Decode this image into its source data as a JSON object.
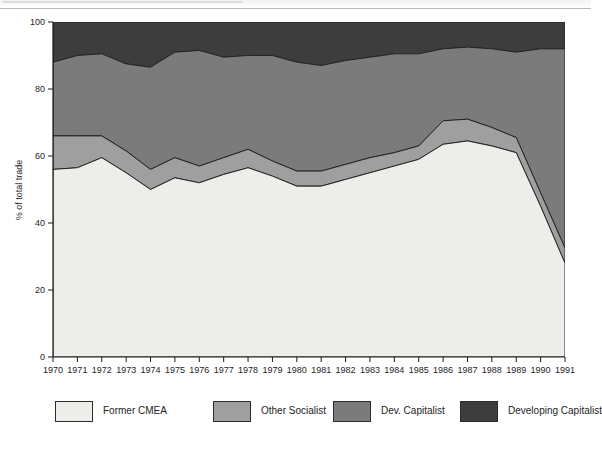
{
  "page": {
    "background_color": "#ffffff",
    "scan_edge": true
  },
  "chart_data": {
    "type": "area",
    "stacked": true,
    "title": "",
    "subtitle": "",
    "xlabel": "",
    "ylabel": "% of total trade",
    "ylim": [
      0,
      100
    ],
    "yticks": [
      0,
      20,
      40,
      60,
      80,
      100
    ],
    "ytick_labels": [
      "0",
      "20",
      "40",
      "60",
      "80",
      "100"
    ],
    "grid": false,
    "legend_position": "bottom",
    "x": [
      1970,
      1971,
      1972,
      1973,
      1974,
      1975,
      1976,
      1977,
      1978,
      1979,
      1980,
      1981,
      1982,
      1983,
      1984,
      1985,
      1986,
      1987,
      1988,
      1989,
      1990,
      1991
    ],
    "xtick_labels": [
      "1970",
      "1971",
      "1972",
      "1973",
      "1974",
      "1975",
      "1976",
      "1977",
      "1978",
      "1979",
      "1980",
      "1981",
      "1982",
      "1983",
      "1984",
      "1985",
      "1986",
      "1987",
      "1988",
      "1989",
      "1990",
      "1991"
    ],
    "series": [
      {
        "name": "Former CMEA",
        "color": "#ededea",
        "values": [
          56,
          56.5,
          59.5,
          55,
          50,
          53.5,
          52,
          54.5,
          56.5,
          54,
          51,
          51,
          53,
          55,
          57,
          59,
          63.5,
          64.5,
          63,
          61,
          45,
          28
        ]
      },
      {
        "name": "Other Socialist",
        "color": "#9f9f9f",
        "values": [
          10,
          9.5,
          6.5,
          6.5,
          6,
          6,
          5,
          5,
          5.5,
          4.5,
          4.5,
          4.5,
          4.5,
          4.5,
          4,
          4,
          7,
          6.5,
          5.5,
          4.5,
          4,
          4.5
        ]
      },
      {
        "name": "Dev. Capitalist",
        "color": "#7b7b7b",
        "values": [
          22,
          24,
          24.5,
          26,
          30.5,
          31.5,
          34.5,
          30,
          28,
          31.5,
          32.5,
          31.5,
          31,
          30,
          29.5,
          27.5,
          21.5,
          21.5,
          23.5,
          25.5,
          43,
          59.5
        ]
      },
      {
        "name": "Developing Capitalist",
        "color": "#3d3d3d",
        "values": [
          12,
          10,
          9.5,
          12.5,
          13.5,
          9,
          8.5,
          10.5,
          10,
          10,
          12,
          13,
          11.5,
          10.5,
          9.5,
          9.5,
          8,
          7.5,
          8,
          9,
          8,
          8
        ]
      }
    ],
    "cumulative_tops": {
      "Former CMEA": [
        56,
        56.5,
        59.5,
        55,
        50,
        53.5,
        52,
        54.5,
        56.5,
        54,
        51,
        51,
        53,
        55,
        57,
        59,
        63.5,
        64.5,
        63,
        61,
        45,
        28
      ],
      "Other Socialist": [
        66,
        66,
        66,
        61.5,
        56,
        59.5,
        57,
        59.5,
        62,
        58.5,
        55.5,
        55.5,
        57.5,
        59.5,
        61,
        63,
        70.5,
        71,
        68.5,
        65.5,
        49,
        32.5
      ],
      "Dev. Capitalist": [
        88,
        90,
        90.5,
        87.5,
        86.5,
        91,
        91.5,
        89.5,
        90,
        90,
        88,
        87,
        88.5,
        89.5,
        90.5,
        90.5,
        92,
        92.5,
        92,
        91,
        92,
        92
      ],
      "Developing Capitalist": [
        100,
        100,
        100,
        100,
        100,
        100,
        100,
        100,
        100,
        100,
        100,
        100,
        100,
        100,
        100,
        100,
        100,
        100,
        100,
        100,
        100,
        100
      ]
    }
  },
  "legend": {
    "items": [
      {
        "label": "Former CMEA",
        "color": "#ededea"
      },
      {
        "label": "Other Socialist",
        "color": "#9f9f9f"
      },
      {
        "label": "Dev. Capitalist",
        "color": "#7b7b7b"
      },
      {
        "label": "Developing Capitalist",
        "color": "#3d3d3d"
      }
    ]
  },
  "axes": {
    "y_label": "% of total trade",
    "y_ticks": [
      "0",
      "20",
      "40",
      "60",
      "80",
      "100"
    ],
    "x_ticks": [
      "1970",
      "1971",
      "1972",
      "1973",
      "1974",
      "1975",
      "1976",
      "1977",
      "1978",
      "1979",
      "1980",
      "1981",
      "1982",
      "1983",
      "1984",
      "1985",
      "1986",
      "1987",
      "1988",
      "1989",
      "1990",
      "1991"
    ]
  }
}
